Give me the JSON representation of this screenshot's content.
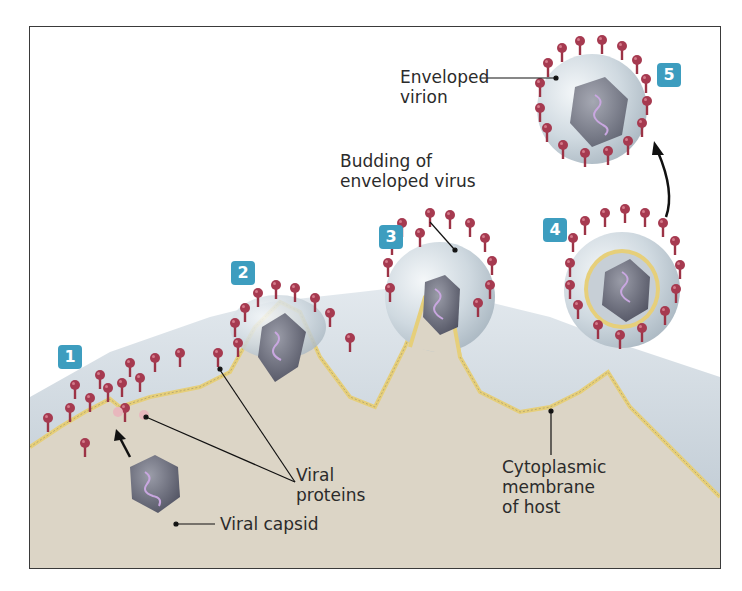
{
  "diagram": {
    "type": "biological-process",
    "colors": {
      "badge": "#3d9dbf",
      "cytoplasm": "#dcd5c6",
      "exterior_layer": "#c9d2da",
      "membrane": "#e6cf7a",
      "spike": "#9c3346",
      "spike_tip": "#b0485c",
      "capsid": "#6d6f7c",
      "genome": "#c9a7e0",
      "envelope": "#d5dfe6",
      "border": "#3a3a3a"
    },
    "steps": [
      {
        "number": "1"
      },
      {
        "number": "2"
      },
      {
        "number": "3"
      },
      {
        "number": "4"
      },
      {
        "number": "5"
      }
    ],
    "labels": {
      "enveloped_virion_line1": "Enveloped",
      "enveloped_virion_line2": "virion",
      "budding_line1": "Budding of",
      "budding_line2": "enveloped virus",
      "viral_proteins_line1": "Viral",
      "viral_proteins_line2": "proteins",
      "viral_capsid": "Viral capsid",
      "membrane_line1": "Cytoplasmic",
      "membrane_line2": "membrane",
      "membrane_line3": "of host"
    }
  }
}
